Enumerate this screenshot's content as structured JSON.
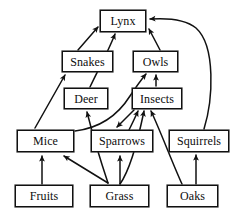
{
  "diagram": {
    "type": "food-web",
    "stroke_color": "#111111",
    "background_color": "#ffffff",
    "nodes": [
      {
        "id": "lynx",
        "label": "Lynx",
        "x": 100,
        "y": 10,
        "w": 46,
        "h": 22,
        "tier": "apex-predator"
      },
      {
        "id": "snakes",
        "label": "Snakes",
        "x": 62,
        "y": 51,
        "w": 51,
        "h": 21,
        "tier": "predator"
      },
      {
        "id": "owls",
        "label": "Owls",
        "x": 133,
        "y": 51,
        "w": 45,
        "h": 21,
        "tier": "predator"
      },
      {
        "id": "deer",
        "label": "Deer",
        "x": 64,
        "y": 88,
        "w": 44,
        "h": 21,
        "tier": "herbivore"
      },
      {
        "id": "insects",
        "label": "Insects",
        "x": 132,
        "y": 88,
        "w": 50,
        "h": 21,
        "tier": "consumer"
      },
      {
        "id": "mice",
        "label": "Mice",
        "x": 17,
        "y": 130,
        "w": 57,
        "h": 22,
        "tier": "consumer"
      },
      {
        "id": "sparrows",
        "label": "Sparrows",
        "x": 91,
        "y": 130,
        "w": 62,
        "h": 22,
        "tier": "consumer"
      },
      {
        "id": "squirrels",
        "label": "Squirrels",
        "x": 169,
        "y": 130,
        "w": 60,
        "h": 22,
        "tier": "consumer"
      },
      {
        "id": "fruits",
        "label": "Fruits",
        "x": 15,
        "y": 185,
        "w": 58,
        "h": 22,
        "tier": "producer"
      },
      {
        "id": "grass",
        "label": "Grass",
        "x": 90,
        "y": 185,
        "w": 59,
        "h": 22,
        "tier": "producer"
      },
      {
        "id": "oaks",
        "label": "Oaks",
        "x": 167,
        "y": 185,
        "w": 51,
        "h": 22,
        "tier": "producer"
      }
    ],
    "edges": [
      {
        "from": "snakes",
        "to": "lynx",
        "shape": "straight"
      },
      {
        "from": "deer",
        "to": "lynx",
        "shape": "curved"
      },
      {
        "from": "owls",
        "to": "lynx",
        "shape": "straight"
      },
      {
        "from": "squirrels",
        "to": "lynx",
        "shape": "curved"
      },
      {
        "from": "mice",
        "to": "snakes",
        "shape": "straight"
      },
      {
        "from": "insects",
        "to": "owls",
        "shape": "straight"
      },
      {
        "from": "mice",
        "to": "owls",
        "shape": "curved"
      },
      {
        "from": "insects",
        "to": "sparrows",
        "shape": "straight"
      },
      {
        "from": "sparrows",
        "to": "insects",
        "shape": "curved"
      },
      {
        "from": "grass",
        "to": "insects",
        "shape": "curved"
      },
      {
        "from": "oaks",
        "to": "insects",
        "shape": "straight"
      },
      {
        "from": "oaks",
        "to": "squirrels",
        "shape": "straight"
      },
      {
        "from": "fruits",
        "to": "mice",
        "shape": "straight"
      },
      {
        "from": "grass",
        "to": "mice",
        "shape": "straight"
      },
      {
        "from": "grass",
        "to": "sparrows",
        "shape": "straight"
      },
      {
        "from": "grass",
        "to": "deer",
        "shape": "straight"
      }
    ]
  }
}
